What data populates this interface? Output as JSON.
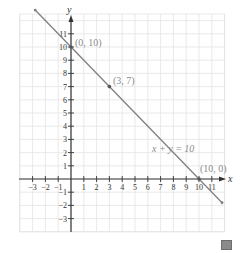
{
  "chart_data": {
    "type": "line",
    "title": "",
    "xlabel": "x",
    "ylabel": "y",
    "xlim": [
      -4,
      12
    ],
    "ylim": [
      -4,
      12.5
    ],
    "grid": true,
    "x_ticks": [
      -3,
      -2,
      -1,
      1,
      2,
      3,
      4,
      5,
      6,
      7,
      8,
      9,
      10,
      11
    ],
    "y_ticks": [
      -3,
      -2,
      -1,
      1,
      2,
      3,
      4,
      5,
      6,
      7,
      8,
      9,
      10,
      11
    ],
    "series": [
      {
        "name": "x + y = 10",
        "equation": "x + y = 10",
        "x": [
          -2.8,
          11.8
        ],
        "y": [
          12.8,
          -1.8
        ],
        "color": "#808080"
      }
    ],
    "points": [
      {
        "x": 0,
        "y": 10,
        "label": "(0, 10)"
      },
      {
        "x": 3,
        "y": 7,
        "label": "(3, 7)"
      },
      {
        "x": 10,
        "y": 0,
        "label": "(10, 0)"
      }
    ],
    "annotations": [
      {
        "text": "x + y = 10",
        "x": 6.3,
        "y": 4.5
      }
    ]
  },
  "labels": {
    "x_axis": "x",
    "y_axis": "y",
    "x_ticks": [
      "−3",
      "−2",
      "−1",
      "1",
      "2",
      "3",
      "4",
      "5",
      "6",
      "7",
      "8",
      "9",
      "10",
      "11"
    ],
    "y_ticks_pos": [
      "1",
      "2",
      "3",
      "4",
      "5",
      "6",
      "7",
      "8",
      "9",
      "10",
      "11"
    ],
    "y_ticks_neg": [
      "−1",
      "−2",
      "−3"
    ],
    "point_0_10": "(0, 10)",
    "point_3_7": "(3, 7)",
    "point_10_0": "(10, 0)",
    "equation": "x + y = 10"
  },
  "colors": {
    "grid": "#e3e3e3",
    "axis": "#333333",
    "line": "#808080",
    "point_label": "#8c8c8c"
  }
}
